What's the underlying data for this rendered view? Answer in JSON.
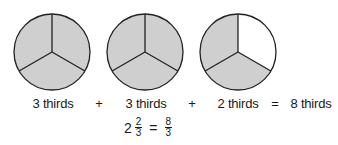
{
  "colors": {
    "shaded": "#cfcfcf",
    "unshaded": "#ffffff",
    "stroke": "#222222"
  },
  "pies": [
    {
      "name": "pie-1",
      "cx": 52,
      "cy": 52,
      "r": 38,
      "shaded_parts": 3,
      "total_parts": 3
    },
    {
      "name": "pie-2",
      "cx": 145,
      "cy": 52,
      "r": 38,
      "shaded_parts": 3,
      "total_parts": 3
    },
    {
      "name": "pie-3",
      "cx": 238,
      "cy": 52,
      "r": 38,
      "shaded_parts": 2,
      "total_parts": 3
    }
  ],
  "equation": {
    "term1": "3 thirds",
    "op1": "+",
    "term2": "3 thirds",
    "op2": "+",
    "term3": "2 thirds",
    "eq": "=",
    "result": "8 thirds"
  },
  "formula": {
    "whole": "2",
    "frac1_num": "2",
    "frac1_den": "3",
    "eq": "=",
    "frac2_num": "8",
    "frac2_den": "3"
  }
}
